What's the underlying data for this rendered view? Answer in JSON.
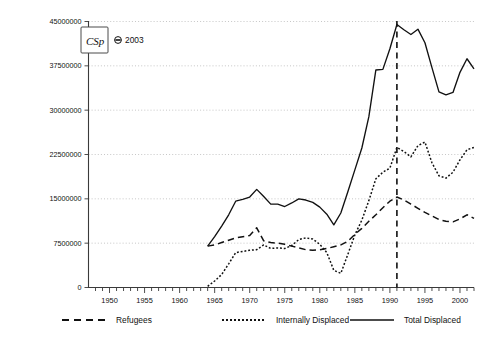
{
  "meta": {
    "copyright": "© 2003",
    "copyright_symbol": "©",
    "copyright_year": "2003",
    "logo_text": "CSp"
  },
  "legend": {
    "position": "below-axis",
    "items": [
      {
        "label": "Refugees",
        "style": "dashed",
        "key": "refugees"
      },
      {
        "label": "Internally Displaced",
        "style": "dotted",
        "key": "internally_displaced"
      },
      {
        "label": "Total Displaced",
        "style": "solid",
        "key": "total_displaced"
      }
    ]
  },
  "annotations": [
    {
      "name": "reference-line-1991",
      "type": "vertical-dashed",
      "x": 1991
    }
  ],
  "chart_data": {
    "type": "line",
    "title": "",
    "subtitle": "",
    "xlabel": "",
    "ylabel": "",
    "xlim": [
      1947,
      2002
    ],
    "ylim": [
      0,
      45000000
    ],
    "grid": true,
    "legend_position": "bottom",
    "yticks": [
      0,
      7500000,
      15000000,
      22500000,
      30000000,
      37500000,
      45000000
    ],
    "ytick_labels": [
      "0",
      "7500000",
      "15000000",
      "22500000",
      "30000000",
      "37500000",
      "45000000"
    ],
    "xticks": [
      1950,
      1955,
      1960,
      1965,
      1970,
      1975,
      1980,
      1985,
      1990,
      1995,
      2000
    ],
    "xtick_labels": [
      "1950",
      "1955",
      "1960",
      "1965",
      "1970",
      "1975",
      "1980",
      "1985",
      "1990",
      "1995",
      "2000"
    ],
    "x": [
      1964,
      1965,
      1966,
      1967,
      1968,
      1969,
      1970,
      1971,
      1972,
      1973,
      1974,
      1975,
      1976,
      1977,
      1978,
      1979,
      1980,
      1981,
      1982,
      1983,
      1984,
      1985,
      1986,
      1987,
      1988,
      1989,
      1990,
      1991,
      1992,
      1993,
      1994,
      1995,
      1996,
      1997,
      1998,
      1999,
      2000,
      2001,
      2002
    ],
    "series": [
      {
        "name": "Total Displaced",
        "style": "solid",
        "values": [
          7000000,
          8600000,
          10400000,
          12300000,
          14600000,
          14900000,
          15300000,
          16600000,
          15400000,
          14100000,
          14100000,
          13700000,
          14300000,
          15000000,
          14800000,
          14400000,
          13600000,
          12400000,
          10600000,
          12600000,
          16200000,
          19900000,
          23600000,
          28900000,
          36800000,
          36900000,
          40400000,
          44500000,
          43600000,
          42800000,
          43700000,
          41400000,
          37200000,
          33100000,
          32600000,
          33000000,
          36400000,
          38700000,
          37000000
        ]
      },
      {
        "name": "Refugees",
        "style": "dashed",
        "values": [
          7000000,
          7200000,
          7600000,
          8000000,
          8400000,
          8600000,
          8800000,
          10100000,
          7900000,
          7600000,
          7500000,
          7300000,
          7000000,
          6700000,
          6400000,
          6300000,
          6400000,
          6600000,
          6900000,
          7200000,
          7800000,
          9000000,
          10000000,
          11200000,
          12300000,
          13500000,
          14600000,
          15300000,
          14800000,
          14100000,
          13400000,
          12700000,
          12100000,
          11500000,
          11200000,
          11100000,
          11600000,
          12300000,
          11700000
        ]
      },
      {
        "name": "Internally Displaced",
        "style": "dotted",
        "values": [
          200000,
          1100000,
          2200000,
          4000000,
          5900000,
          6100000,
          6300000,
          6400000,
          7200000,
          6600000,
          6700000,
          6600000,
          7100000,
          8100000,
          8400000,
          8200000,
          7300000,
          5900000,
          2900000,
          2400000,
          5600000,
          8900000,
          11400000,
          14700000,
          18400000,
          19500000,
          20200000,
          23700000,
          23000000,
          22100000,
          24000000,
          24600000,
          21100000,
          18900000,
          18500000,
          19500000,
          21600000,
          23300000,
          23700000
        ]
      }
    ]
  }
}
